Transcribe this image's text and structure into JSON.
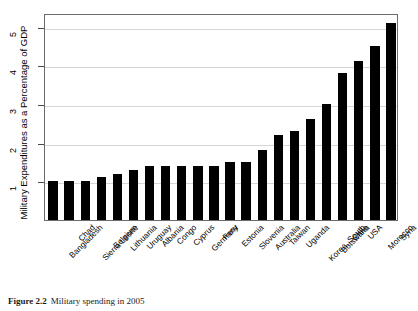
{
  "chart_data": {
    "type": "bar",
    "title": "",
    "xlabel": "",
    "ylabel": "Military Expenditures as a Percentage of GDP",
    "ylim": [
      0,
      5.35
    ],
    "yticks": [
      1,
      2,
      3,
      4,
      5
    ],
    "ytick_labels": [
      "1",
      "2",
      "3",
      "4",
      "5"
    ],
    "grid": true,
    "legend": false,
    "bar_color": "#000000",
    "categories": [
      "Bangladesh",
      "Chad",
      "Sierra Leone",
      "Belgium",
      "Lithuania",
      "Uruguay",
      "Albania",
      "Congo",
      "Cyprus",
      "Germany",
      "Peru",
      "Estonia",
      "Slovenia",
      "Australia",
      "Taiwan",
      "Uganda",
      "Korea, South",
      "Botswana",
      "Chile",
      "USA",
      "Morocco",
      "Syria"
    ],
    "values": [
      1.0,
      1.0,
      1.0,
      1.1,
      1.2,
      1.3,
      1.4,
      1.4,
      1.4,
      1.4,
      1.4,
      1.5,
      1.5,
      1.8,
      2.2,
      2.3,
      2.6,
      3.0,
      3.8,
      4.1,
      4.5,
      5.1
    ]
  },
  "caption": {
    "label": "Figure 2.2",
    "text": "Military spending in 2005"
  }
}
